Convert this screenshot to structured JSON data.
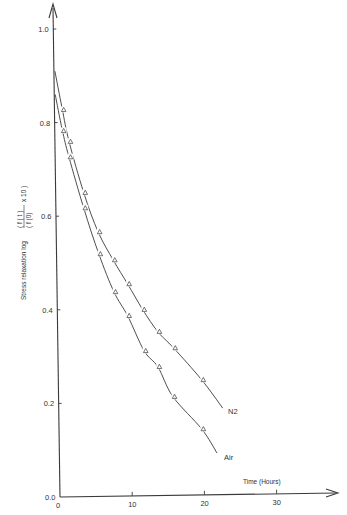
{
  "chart_data": {
    "type": "line",
    "title": "",
    "xlabel": "Time (Hours)",
    "ylabel": "Stress relaxation log (f(t)/f(0) x 10)",
    "ylabel_parts": {
      "prefix": "Stress relaxation  log",
      "numerator": "( f ( t )",
      "denominator": "( f (0)",
      "suffix": "x 10 )"
    },
    "xlim": [
      0,
      38
    ],
    "ylim": [
      0.0,
      1.05
    ],
    "x_ticks": [
      0,
      10,
      20,
      30
    ],
    "x_tick_labels": [
      "0",
      "10",
      "20",
      "30"
    ],
    "y_ticks": [
      0.0,
      0.2,
      0.4,
      0.6,
      0.8,
      1.0
    ],
    "y_tick_labels": [
      "0.0",
      "0.2",
      "0.4",
      "0.6",
      "0.8",
      "1.0"
    ],
    "grid": false,
    "legend": "inline labels at curve ends",
    "marker": "triangle-open",
    "series": [
      {
        "name": "N2",
        "label": "N2",
        "curve": [
          [
            0,
            0.91
          ],
          [
            0.3,
            0.83
          ],
          [
            1.25,
            0.76
          ],
          [
            3.3,
            0.65
          ],
          [
            5.3,
            0.566
          ],
          [
            7.4,
            0.506
          ],
          [
            9.4,
            0.455
          ],
          [
            11.5,
            0.4
          ],
          [
            13.6,
            0.353
          ],
          [
            15.8,
            0.318
          ],
          [
            19.7,
            0.25
          ],
          [
            22.6,
            0.19
          ]
        ],
        "points": [
          [
            0.3,
            0.827
          ],
          [
            1.25,
            0.759
          ],
          [
            3.3,
            0.65
          ],
          [
            5.3,
            0.566
          ],
          [
            7.4,
            0.506
          ],
          [
            9.4,
            0.455
          ],
          [
            11.5,
            0.4
          ],
          [
            13.6,
            0.353
          ],
          [
            15.8,
            0.318
          ],
          [
            19.7,
            0.25
          ]
        ]
      },
      {
        "name": "Air",
        "label": "Air",
        "curve": [
          [
            0,
            0.86
          ],
          [
            0.3,
            0.785
          ],
          [
            1.25,
            0.726
          ],
          [
            3.3,
            0.617
          ],
          [
            5.4,
            0.519
          ],
          [
            7.5,
            0.438
          ],
          [
            9.4,
            0.387
          ],
          [
            11.7,
            0.312
          ],
          [
            13.6,
            0.278
          ],
          [
            15.7,
            0.214
          ],
          [
            19.7,
            0.145
          ],
          [
            21.8,
            0.094
          ]
        ],
        "points": [
          [
            0.3,
            0.782
          ],
          [
            1.25,
            0.726
          ],
          [
            3.3,
            0.617
          ],
          [
            5.4,
            0.519
          ],
          [
            7.5,
            0.438
          ],
          [
            9.4,
            0.387
          ],
          [
            11.7,
            0.312
          ],
          [
            13.6,
            0.278
          ],
          [
            15.7,
            0.214
          ],
          [
            19.7,
            0.145
          ]
        ]
      }
    ]
  }
}
